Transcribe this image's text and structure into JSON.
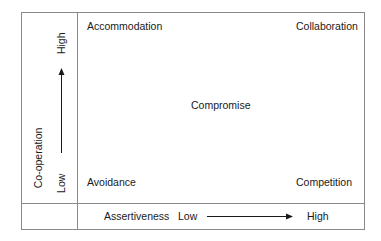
{
  "diagram": {
    "type": "conflict-modes-matrix",
    "quadrants": {
      "top_left": "Accommodation",
      "top_right": "Collaboration",
      "center": "Compromise",
      "bottom_left": "Avoidance",
      "bottom_right": "Competition"
    },
    "y_axis": {
      "title": "Co-operation",
      "low_label": "Low",
      "high_label": "High"
    },
    "x_axis": {
      "title": "Assertiveness",
      "low_label": "Low",
      "high_label": "High"
    },
    "colors": {
      "border": "#8a8a8a",
      "text": "#1a1a1a",
      "arrow": "#1a1a1a"
    }
  }
}
